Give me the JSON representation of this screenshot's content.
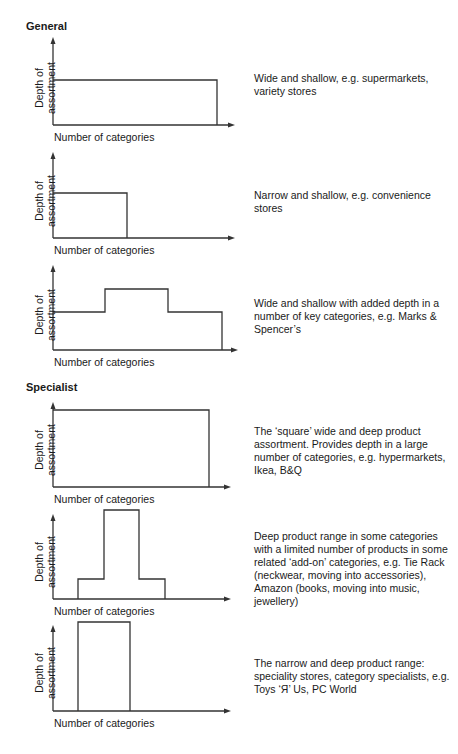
{
  "sections": {
    "general": {
      "title": "General"
    },
    "specialist": {
      "title": "Specialist"
    }
  },
  "axis": {
    "y_label_line1": "Depth of",
    "y_label_line2": "assortment",
    "x_label": "Number of categories"
  },
  "panels": [
    {
      "id": "general-1",
      "group": "General",
      "shape": "wide-shallow",
      "description": "Wide and shallow, e.g. supermarkets, variety stores"
    },
    {
      "id": "general-2",
      "group": "General",
      "shape": "narrow-shallow",
      "description": "Narrow and shallow, e.g. convenience stores"
    },
    {
      "id": "general-3",
      "group": "General",
      "shape": "wide-shallow-with-added-depth",
      "description": "Wide and shallow with added depth in a number of key categories, e.g. Marks & Spencer’s"
    },
    {
      "id": "specialist-1",
      "group": "Specialist",
      "shape": "square-wide-deep",
      "description": "The ‘square’ wide and deep product assortment. Provides depth in a large number of categories, e.g. hypermarkets, Ikea, B&Q"
    },
    {
      "id": "specialist-2",
      "group": "Specialist",
      "shape": "deep-core-with-add-ons",
      "description": "Deep product range in some categories with a limited number of products in some related ‘add-on’ categories, e.g. Tie Rack (neckwear, moving into accessories), Amazon (books, moving into music, jewellery)"
    },
    {
      "id": "specialist-3",
      "group": "Specialist",
      "shape": "narrow-deep",
      "description": "The narrow and deep product range: speciality stores, category specialists, e.g. Toys ‘Я’ Us, PC World"
    }
  ],
  "colors": {
    "line": "#333333",
    "text": "#1a1a1a",
    "background": "#ffffff"
  }
}
